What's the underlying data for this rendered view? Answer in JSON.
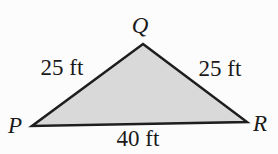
{
  "figure": {
    "type": "triangle",
    "colors": {
      "fill": "#d9d9d9",
      "stroke": "#1e1e1e",
      "background": "#fcfcfc",
      "text": "#1a1a1a"
    },
    "vertices": {
      "top": "Q",
      "bottom_left": "P",
      "bottom_right": "R"
    },
    "sides": {
      "left": "25 ft",
      "right": "25 ft",
      "bottom": "40 ft"
    }
  }
}
